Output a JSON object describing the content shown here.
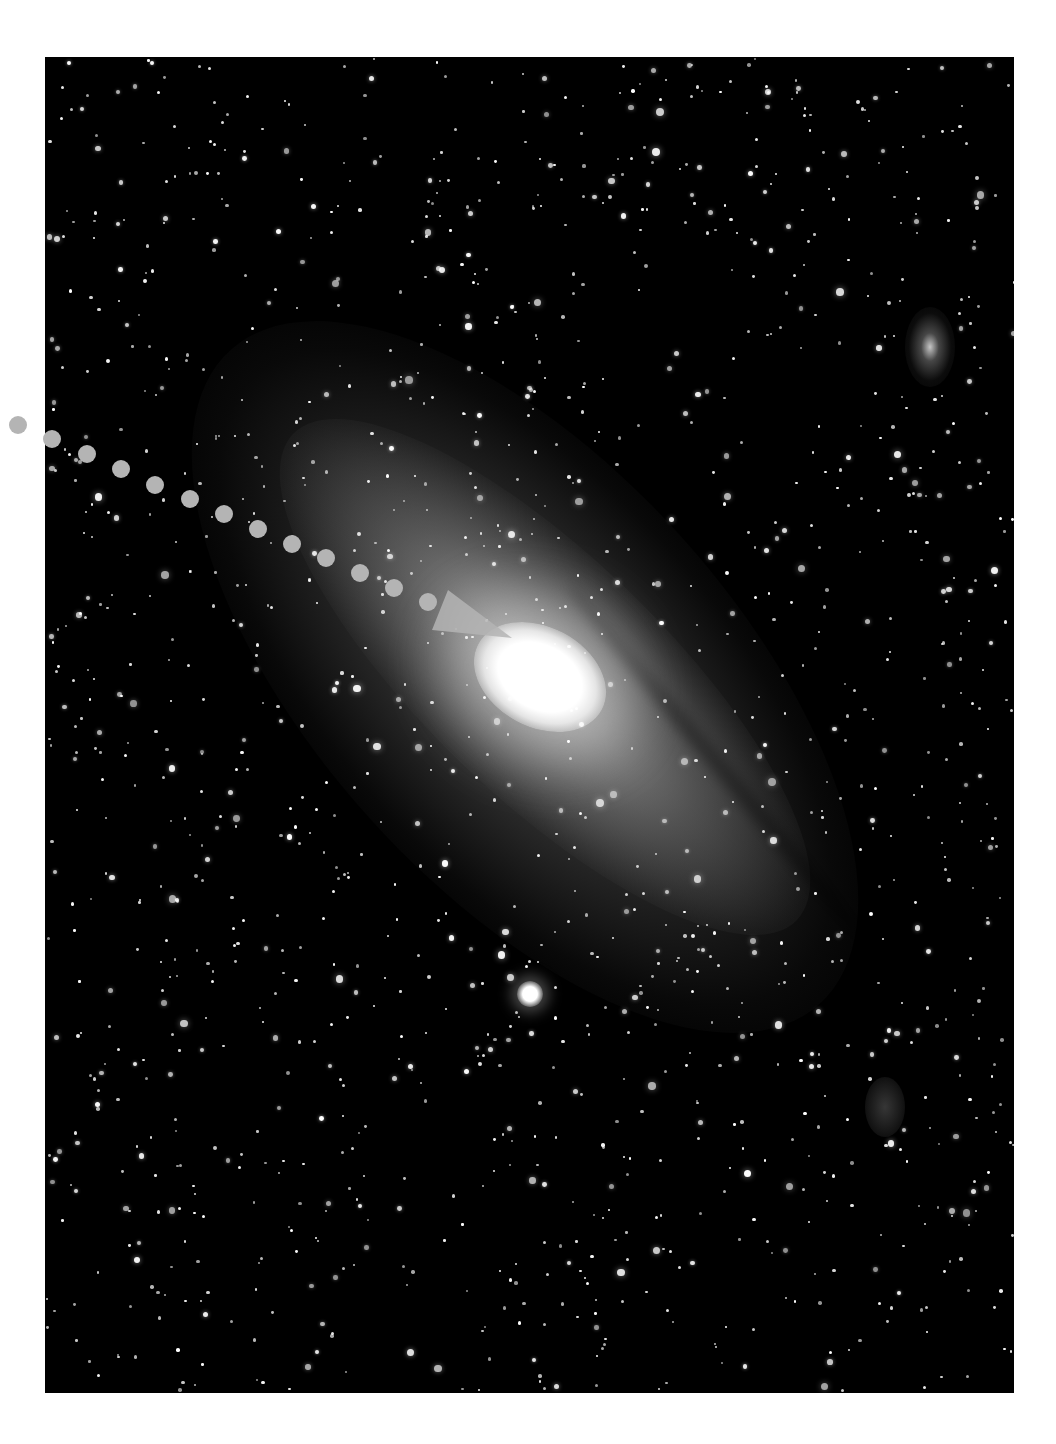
{
  "image": {
    "subject": "Andromeda galaxy (M31) with companions",
    "frame": {
      "left": 45,
      "top": 57,
      "width": 969,
      "height": 1336,
      "background": "#000000"
    }
  },
  "annotation": {
    "type": "dotted-arrow",
    "color": "#b4b4b4",
    "dot_diameter": 18,
    "dots": [
      [
        18,
        425
      ],
      [
        52,
        439
      ],
      [
        87,
        454
      ],
      [
        121,
        469
      ],
      [
        155,
        485
      ],
      [
        190,
        499
      ],
      [
        224,
        514
      ],
      [
        258,
        529
      ],
      [
        292,
        544
      ],
      [
        326,
        558
      ],
      [
        360,
        573
      ],
      [
        394,
        588
      ],
      [
        428,
        602
      ]
    ],
    "arrowhead": {
      "points": [
        [
          448,
          590
        ],
        [
          512,
          638
        ],
        [
          432,
          630
        ]
      ]
    },
    "points_to": "galaxy-core"
  },
  "features": {
    "core_color": "#ffffff",
    "star_color": "#ffffff"
  }
}
